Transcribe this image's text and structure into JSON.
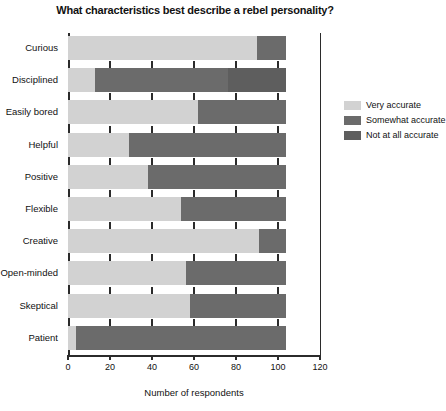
{
  "chart_data": {
    "type": "bar",
    "orientation": "horizontal",
    "stacked": true,
    "title": "What characteristics best describe a rebel personality?",
    "xlabel": "Number of respondents",
    "ylabel": "",
    "xlim": [
      0,
      120
    ],
    "xticks": [
      0,
      20,
      40,
      60,
      80,
      100,
      120
    ],
    "xticklabels": [
      "0",
      "20",
      "40",
      "60",
      "80",
      "100",
      "120"
    ],
    "grid": false,
    "legend_position": "right",
    "categories": [
      "Curious",
      "Disciplined",
      "Easily bored",
      "Helpful",
      "Positive",
      "Flexible",
      "Creative",
      "Open-minded",
      "Skeptical",
      "Patient"
    ],
    "series": [
      {
        "name": "Very accurate",
        "color": "#d2d2d2",
        "values": [
          90,
          13,
          62,
          29,
          38,
          54,
          91,
          56,
          58,
          4
        ]
      },
      {
        "name": "Somewhat accurate",
        "color": "#6b6b6b",
        "values": [
          14,
          63,
          42,
          75,
          66,
          50,
          13,
          48,
          46,
          100
        ]
      },
      {
        "name": "Not at all accurate",
        "color": "#5e5e5e",
        "values": [
          0,
          28,
          0,
          0,
          0,
          0,
          0,
          0,
          0,
          0
        ]
      }
    ],
    "totals": [
      104,
      104,
      104,
      104,
      104,
      104,
      104,
      104,
      104,
      104
    ]
  },
  "legend": {
    "items": [
      {
        "label": "Very accurate",
        "color": "#d2d2d2"
      },
      {
        "label": "Somewhat accurate",
        "color": "#6b6b6b"
      },
      {
        "label": "Not at all accurate",
        "color": "#5e5e5e"
      }
    ]
  }
}
